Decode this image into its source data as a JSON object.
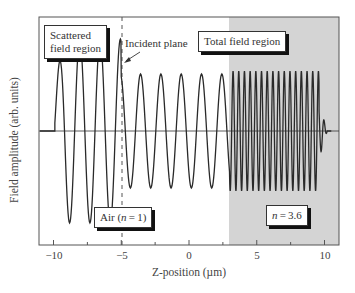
{
  "chart_data": {
    "type": "line",
    "title": "",
    "xlabel": "Z-position (µm)",
    "ylabel": "Field amplitude (arb. units)",
    "xlim": [
      -11,
      11
    ],
    "ylim": [
      -1.1,
      1.1
    ],
    "xticks": [
      -10,
      -5,
      0,
      5,
      10
    ],
    "xtick_labels": [
      "−10",
      "−5",
      "0",
      "5",
      "10"
    ],
    "grid": false,
    "legend": null,
    "series": [
      {
        "name": "Field amplitude",
        "description": "Sinusoidal field: ramps in near z=-10, large amplitude (~1.0) standing-wave region for z<-5, lower amplitude (~0.62) for -5<z<3, high-frequency (~0.65 amplitude) oscillation in n=3.6 region from z=3 to ~9.5, tapering to zero near z=10",
        "segments": [
          {
            "z_range": [
              -10.5,
              -9.9
            ],
            "amplitude": 0.0,
            "period_um": 1.5
          },
          {
            "z_range": [
              -9.9,
              -5.0
            ],
            "amplitude": 1.0,
            "period_um": 1.5
          },
          {
            "z_range": [
              -5.0,
              3.0
            ],
            "amplitude": 0.62,
            "period_um": 1.5
          },
          {
            "z_range": [
              3.0,
              9.6
            ],
            "amplitude": 0.65,
            "period_um": 0.42
          },
          {
            "z_range": [
              9.6,
              10.2
            ],
            "amplitude": 0.3,
            "period_um": 0.42
          }
        ]
      }
    ],
    "regions": [
      {
        "name": "Air",
        "z_range": [
          -11,
          3
        ],
        "fill": "#ffffff"
      },
      {
        "name": "n=3.6",
        "z_range": [
          3,
          11
        ],
        "fill": "#d4d4d4"
      }
    ],
    "vlines": [
      {
        "z": -5,
        "style": "dashed",
        "label": "Incident plane"
      }
    ],
    "annotations": [
      {
        "text": "Scattered field region",
        "boxed": true
      },
      {
        "text": "Incident plane",
        "arrow": true
      },
      {
        "text": "Total field region",
        "boxed": true
      },
      {
        "text": "Air (n = 1)",
        "boxed": true
      },
      {
        "text": "n = 3.6",
        "boxed": true
      }
    ]
  },
  "labels": {
    "scattered_line1": "Scattered",
    "scattered_line2": "field region",
    "incident": "Incident plane",
    "total": "Total field region",
    "air": "Air (n = 1)",
    "air_prefix": "Air (",
    "air_n": "n",
    "air_suffix": " = 1)",
    "n36_n": "n",
    "n36_suffix": " = 3.6",
    "xlabel": "Z-position (µm)",
    "ylabel": "Field amplitude (arb. units)",
    "xticks": [
      "−10",
      "−5",
      "0",
      "5",
      "10"
    ]
  },
  "colors": {
    "shade": "#d4d4d4",
    "line": "#2a2a2a",
    "axis": "#555555"
  }
}
